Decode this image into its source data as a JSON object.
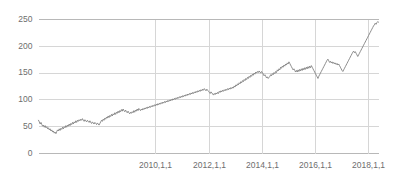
{
  "chart_data": {
    "type": "line",
    "title": "",
    "subtitle": "",
    "xlabel": "",
    "ylabel": "",
    "grid": true,
    "legend": false,
    "legend_position": "none",
    "line_color": "#808080",
    "grid_color": "#d6d6d6",
    "axis_color": "#b8b8b8",
    "label_color": "#6e6e6e",
    "background": "#ffffff",
    "ylim": [
      0,
      250
    ],
    "yticks": [
      0,
      50,
      100,
      150,
      200,
      250
    ],
    "ytick_labels": [
      "0",
      "50",
      "100",
      "150",
      "200",
      "250"
    ],
    "xlim": [
      "2008-07-01",
      "2019-02-01"
    ],
    "xticks": [
      "2010,1,1",
      "2012,1,1",
      "2014,1,1",
      "2016,1,1",
      "2018,1,1"
    ],
    "xtick_labels": [
      "2010,1,1",
      "2012,1,1",
      "2014,1,1",
      "2016,1,1",
      "2018,1,1"
    ],
    "xtick_positions_frac": [
      0.3433,
      0.5,
      0.6567,
      0.8134,
      0.97
    ],
    "series": [
      {
        "name": "series-1",
        "color": "#808080",
        "start_value": 62,
        "end_value": 245,
        "min_value": 37,
        "max_value": 246,
        "values": [
          62,
          59,
          55,
          58,
          54,
          51,
          53,
          49,
          52,
          48,
          50,
          46,
          48,
          44,
          46,
          42,
          44,
          40,
          42,
          38,
          40,
          37,
          41,
          44,
          42,
          46,
          43,
          47,
          45,
          49,
          46,
          50,
          48,
          52,
          49,
          53,
          51,
          55,
          52,
          56,
          54,
          58,
          55,
          59,
          57,
          61,
          58,
          62,
          60,
          63,
          61,
          64,
          62,
          65,
          62,
          60,
          63,
          61,
          59,
          62,
          60,
          58,
          61,
          58,
          56,
          59,
          57,
          55,
          58,
          56,
          54,
          57,
          55,
          53,
          56,
          59,
          62,
          60,
          64,
          62,
          66,
          64,
          68,
          66,
          70,
          67,
          71,
          69,
          73,
          70,
          74,
          72,
          76,
          73,
          77,
          75,
          79,
          76,
          80,
          78,
          82,
          79,
          83,
          80,
          78,
          81,
          78,
          76,
          79,
          76,
          74,
          77,
          75,
          78,
          76,
          80,
          77,
          81,
          79,
          83,
          80,
          84,
          82,
          80,
          83,
          81,
          84,
          82,
          85,
          83,
          86,
          84,
          87,
          85,
          88,
          86,
          89,
          87,
          90,
          88,
          91,
          89,
          92,
          90,
          93,
          91,
          94,
          92,
          95,
          93,
          96,
          94,
          97,
          95,
          98,
          96,
          99,
          97,
          100,
          98,
          101,
          99,
          102,
          100,
          103,
          101,
          104,
          102,
          105,
          103,
          106,
          104,
          107,
          105,
          108,
          106,
          109,
          107,
          110,
          108,
          111,
          109,
          112,
          110,
          113,
          111,
          114,
          112,
          115,
          113,
          116,
          114,
          117,
          115,
          118,
          116,
          119,
          117,
          120,
          118,
          121,
          119,
          117,
          120,
          118,
          116,
          114,
          112,
          115,
          113,
          111,
          109,
          112,
          110,
          113,
          111,
          114,
          112,
          116,
          114,
          117,
          115,
          118,
          116,
          119,
          117,
          120,
          118,
          121,
          119,
          122,
          120,
          123,
          121,
          124,
          122,
          126,
          124,
          128,
          126,
          130,
          128,
          132,
          130,
          134,
          132,
          136,
          134,
          138,
          136,
          140,
          138,
          142,
          140,
          144,
          142,
          146,
          144,
          148,
          146,
          150,
          148,
          152,
          150,
          153,
          151,
          154,
          152,
          150,
          153,
          151,
          148,
          145,
          147,
          144,
          141,
          143,
          140,
          142,
          144,
          147,
          145,
          149,
          147,
          151,
          149,
          153,
          151,
          156,
          154,
          158,
          156,
          161,
          159,
          163,
          161,
          165,
          163,
          167,
          165,
          169,
          167,
          171,
          168,
          165,
          162,
          159,
          156,
          158,
          155,
          152,
          155,
          152,
          156,
          153,
          157,
          154,
          158,
          155,
          159,
          156,
          160,
          157,
          161,
          158,
          162,
          159,
          163,
          160,
          164,
          161,
          158,
          155,
          152,
          149,
          146,
          143,
          140,
          144,
          147,
          150,
          153,
          156,
          159,
          162,
          165,
          168,
          171,
          174,
          176,
          173,
          170,
          172,
          169,
          171,
          168,
          170,
          167,
          169,
          166,
          168,
          165,
          167,
          164,
          161,
          158,
          155,
          153,
          156,
          159,
          162,
          165,
          168,
          171,
          174,
          177,
          180,
          183,
          186,
          189,
          191,
          188,
          190,
          187,
          184,
          181,
          184,
          187,
          190,
          193,
          196,
          199,
          202,
          205,
          208,
          211,
          214,
          217,
          220,
          223,
          226,
          229,
          232,
          235,
          238,
          240,
          243,
          241,
          244,
          246,
          245
        ]
      }
    ]
  }
}
